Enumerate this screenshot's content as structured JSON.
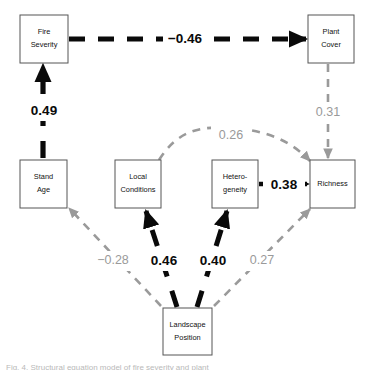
{
  "figure": {
    "type": "path-diagram",
    "caption_partial": "Fig. 4. Structural equation model of fire severity and plant"
  },
  "nodes": [
    {
      "id": "fire-severity",
      "label_line1": "Fire",
      "label_line2": "Severity",
      "x": 20,
      "y": 15,
      "w": 48,
      "h": 48
    },
    {
      "id": "plant-cover",
      "label_line1": "Plant",
      "label_line2": "Cover",
      "x": 308,
      "y": 15,
      "w": 46,
      "h": 48
    },
    {
      "id": "stand-age",
      "label_line1": "Stand",
      "label_line2": "Age",
      "x": 20,
      "y": 160,
      "w": 47,
      "h": 48
    },
    {
      "id": "local-conditions",
      "label_line1": "Local",
      "label_line2": "Conditions",
      "x": 115,
      "y": 160,
      "w": 46,
      "h": 48
    },
    {
      "id": "heterogeneity",
      "label_line1": "Hetero-",
      "label_line2": "geneity",
      "x": 212,
      "y": 160,
      "w": 46,
      "h": 48
    },
    {
      "id": "richness",
      "label_line1": "Richness",
      "label_line2": "",
      "x": 310,
      "y": 160,
      "w": 45,
      "h": 48
    },
    {
      "id": "landscape-position",
      "label_line1": "Landscape",
      "label_line2": "Position",
      "x": 163,
      "y": 308,
      "w": 49,
      "h": 47
    }
  ],
  "paths": [
    {
      "id": "fire-severity-to-plant-cover",
      "from": "fire-severity",
      "to": "plant-cover",
      "coefficient": "−0.46",
      "strength": "strong",
      "label_x": 185,
      "label_y": 38
    },
    {
      "id": "stand-age-to-fire-severity",
      "from": "stand-age",
      "to": "fire-severity",
      "coefficient": "0.49",
      "strength": "strong",
      "label_x": 44,
      "label_y": 110
    },
    {
      "id": "plant-cover-to-richness",
      "from": "plant-cover",
      "to": "richness",
      "coefficient": "0.31",
      "strength": "weak",
      "label_x": 328,
      "label_y": 113
    },
    {
      "id": "local-conditions-to-richness",
      "from": "local-conditions",
      "to": "richness",
      "coefficient": "0.26",
      "strength": "weak",
      "label_x": 231,
      "label_y": 136
    },
    {
      "id": "heterogeneity-to-richness",
      "from": "heterogeneity",
      "to": "richness",
      "coefficient": "0.38",
      "strength": "strong",
      "label_x": 284,
      "label_y": 184
    },
    {
      "id": "landscape-position-to-stand-age",
      "from": "landscape-position",
      "to": "stand-age",
      "coefficient": "−0.28",
      "strength": "weak",
      "label_x": 113,
      "label_y": 261
    },
    {
      "id": "landscape-position-to-local-conditions",
      "from": "landscape-position",
      "to": "local-conditions",
      "coefficient": "0.46",
      "strength": "strong",
      "label_x": 164,
      "label_y": 261
    },
    {
      "id": "landscape-position-to-heterogeneity",
      "from": "landscape-position",
      "to": "heterogeneity",
      "coefficient": "0.40",
      "strength": "strong",
      "label_x": 213,
      "label_y": 261
    },
    {
      "id": "landscape-position-to-richness",
      "from": "landscape-position",
      "to": "richness",
      "coefficient": "0.27",
      "strength": "weak",
      "label_x": 262,
      "label_y": 261
    }
  ],
  "colors": {
    "strong": "#0a0a0a",
    "weak": "#9a9a9a",
    "box_stroke": "#555555",
    "background": "#ffffff"
  }
}
